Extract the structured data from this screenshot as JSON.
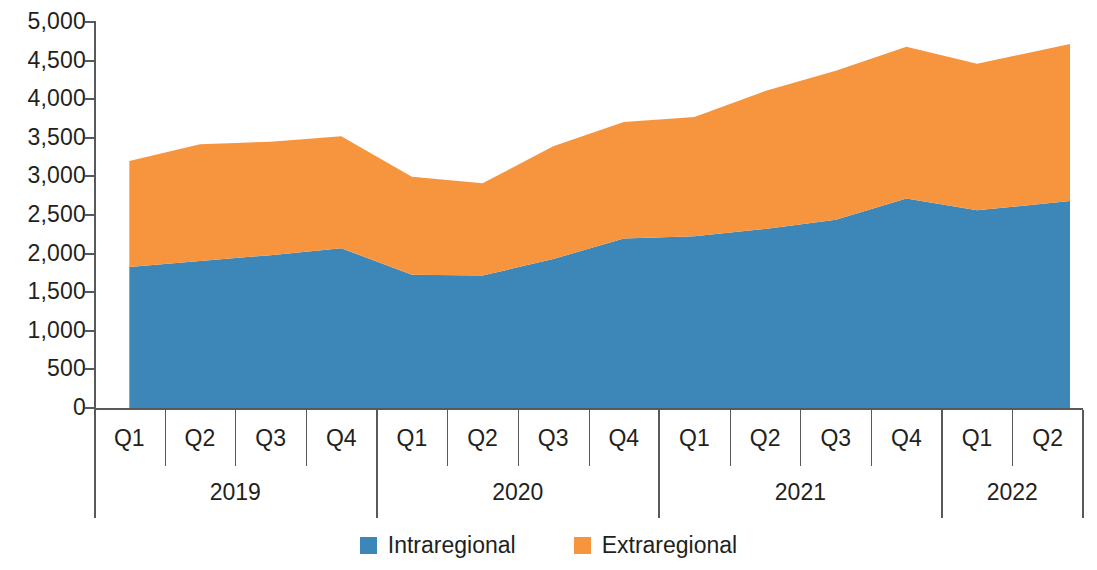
{
  "chart_data": {
    "type": "area",
    "stacked": true,
    "title": "",
    "xlabel": "",
    "ylabel": "",
    "ylim": [
      0,
      5000
    ],
    "ytick_step": 500,
    "ytick_labels": [
      "5,000",
      "4,500",
      "4,000",
      "3,500",
      "3,000",
      "2,500",
      "2,000",
      "1,500",
      "1,000",
      "500",
      "0"
    ],
    "ytick_values": [
      5000,
      4500,
      4000,
      3500,
      3000,
      2500,
      2000,
      1500,
      1000,
      500,
      0
    ],
    "grid": false,
    "legend_position": "bottom-center",
    "categories": [
      "Q1",
      "Q2",
      "Q3",
      "Q4",
      "Q1",
      "Q2",
      "Q3",
      "Q4",
      "Q1",
      "Q2",
      "Q3",
      "Q4",
      "Q1",
      "Q2"
    ],
    "year_groups": [
      {
        "label": "2019",
        "quarters": [
          "Q1",
          "Q2",
          "Q3",
          "Q4"
        ]
      },
      {
        "label": "2020",
        "quarters": [
          "Q1",
          "Q2",
          "Q3",
          "Q4"
        ]
      },
      {
        "label": "2021",
        "quarters": [
          "Q1",
          "Q2",
          "Q3",
          "Q4"
        ]
      },
      {
        "label": "2022",
        "quarters": [
          "Q1",
          "Q2"
        ]
      }
    ],
    "series": [
      {
        "name": "Intraregional",
        "color": "#3D86B8",
        "values": [
          1825,
          1905,
          1980,
          2070,
          1725,
          1715,
          1930,
          2195,
          2225,
          2320,
          2440,
          2715,
          2560,
          2680
        ]
      },
      {
        "name": "Extraregional",
        "color": "#F7943E",
        "values": [
          1375,
          1510,
          1470,
          1450,
          1270,
          1195,
          1460,
          1510,
          1545,
          1785,
          1930,
          1965,
          1900,
          2035
        ]
      }
    ],
    "totals": [
      3200,
      3415,
      3450,
      3520,
      2995,
      2910,
      3390,
      3705,
      3770,
      4105,
      4370,
      4680,
      4460,
      4715
    ]
  },
  "legend": {
    "items": [
      {
        "label": "Intraregional",
        "color": "#3D86B8",
        "swatch_name": "legend-swatch-intraregional"
      },
      {
        "label": "Extraregional",
        "color": "#F7943E",
        "swatch_name": "legend-swatch-extraregional"
      }
    ]
  }
}
